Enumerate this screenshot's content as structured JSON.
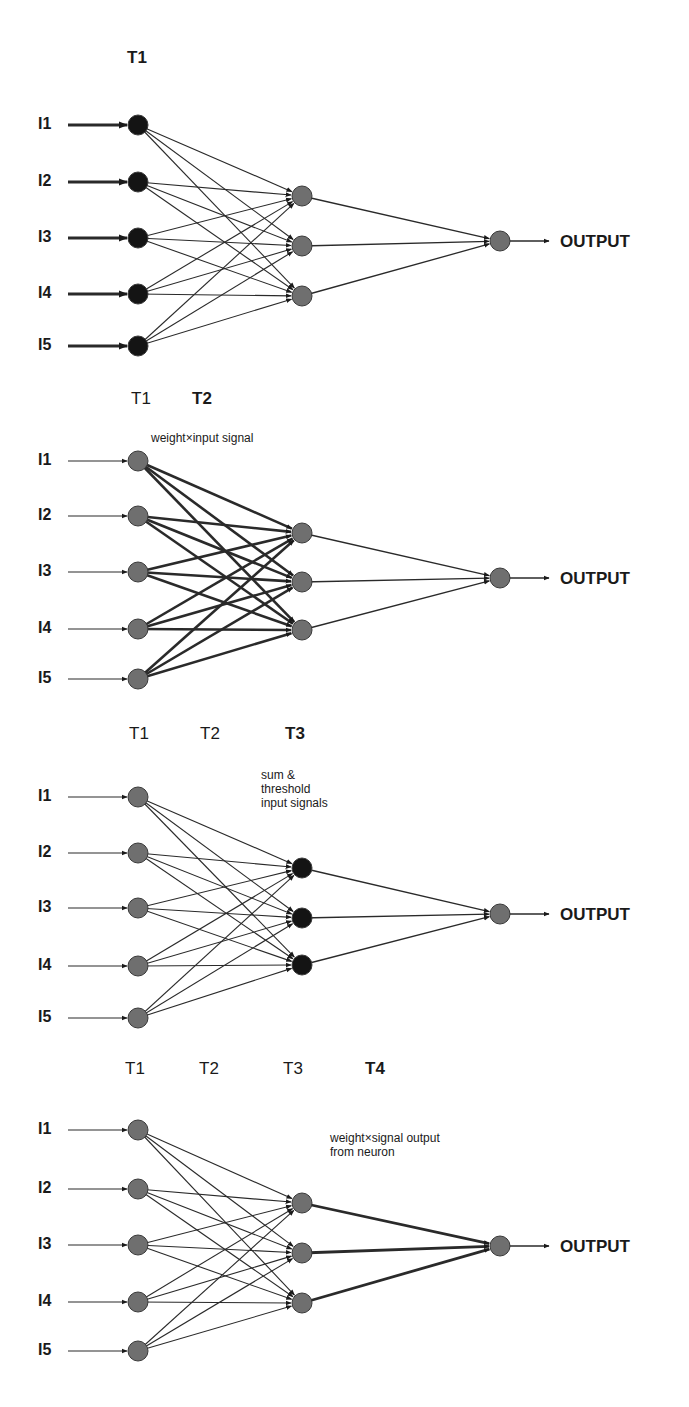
{
  "colors": {
    "node_dark": "#141414",
    "node_gray": "#6f6f6f",
    "edge": "#2a2a2a",
    "text": "#1a1a1a"
  },
  "output_label": "OUTPUT",
  "input_labels": [
    "I1",
    "I2",
    "I3",
    "I4",
    "I5"
  ],
  "panels": [
    {
      "id": "panel-1",
      "time_labels": [
        {
          "text": "T1",
          "x": 127,
          "y": 48,
          "bold": true
        }
      ],
      "note": null,
      "inputs_y": [
        125,
        182,
        238,
        294,
        346
      ],
      "hidden_y": [
        196,
        246,
        296
      ],
      "output_y": 241,
      "input_nodes": "dark",
      "hidden_nodes": "gray",
      "input_arrows": "thick",
      "input_hidden_edges": "normal",
      "hidden_output_edges": "normal"
    },
    {
      "id": "panel-2",
      "time_labels": [
        {
          "text": "T1",
          "x": 131,
          "y": 389,
          "bold": false
        },
        {
          "text": "T2",
          "x": 192,
          "y": 389,
          "bold": true
        }
      ],
      "note": {
        "lines": [
          "weight×input signal"
        ],
        "x": 151,
        "y": 431
      },
      "inputs_y": [
        461,
        516,
        572,
        629,
        679
      ],
      "hidden_y": [
        533,
        582,
        630
      ],
      "output_y": 578,
      "input_nodes": "gray",
      "hidden_nodes": "gray",
      "input_arrows": "thin",
      "input_hidden_edges": "thick",
      "hidden_output_edges": "normal"
    },
    {
      "id": "panel-3",
      "time_labels": [
        {
          "text": "T1",
          "x": 129,
          "y": 724,
          "bold": false
        },
        {
          "text": "T2",
          "x": 200,
          "y": 724,
          "bold": false
        },
        {
          "text": "T3",
          "x": 285,
          "y": 724,
          "bold": true
        }
      ],
      "note": {
        "lines": [
          "sum &",
          "threshold",
          "input signals"
        ],
        "x": 261,
        "y": 768
      },
      "inputs_y": [
        797,
        853,
        908,
        966,
        1018
      ],
      "hidden_y": [
        868,
        918,
        965
      ],
      "output_y": 914,
      "input_nodes": "gray",
      "hidden_nodes": "dark",
      "input_arrows": "thin",
      "input_hidden_edges": "normal",
      "hidden_output_edges": "normal"
    },
    {
      "id": "panel-4",
      "time_labels": [
        {
          "text": "T1",
          "x": 125,
          "y": 1059,
          "bold": false
        },
        {
          "text": "T2",
          "x": 199,
          "y": 1059,
          "bold": false
        },
        {
          "text": "T3",
          "x": 283,
          "y": 1059,
          "bold": false
        },
        {
          "text": "T4",
          "x": 365,
          "y": 1059,
          "bold": true
        }
      ],
      "note": {
        "lines": [
          "weight×signal output",
          "from neuron"
        ],
        "x": 330,
        "y": 1131
      },
      "inputs_y": [
        1130,
        1189,
        1245,
        1302,
        1351
      ],
      "hidden_y": [
        1203,
        1253,
        1303
      ],
      "output_y": 1246,
      "input_nodes": "gray",
      "hidden_nodes": "gray",
      "input_arrows": "thin",
      "input_hidden_edges": "normal",
      "hidden_output_edges": "thick"
    }
  ],
  "layout": {
    "input_label_x": 38,
    "arrow_start_x": 68,
    "input_node_x": 138,
    "hidden_node_x": 302,
    "output_node_x": 500,
    "output_arrow_end_x": 549,
    "output_label_x": 560,
    "node_radius": 10
  }
}
